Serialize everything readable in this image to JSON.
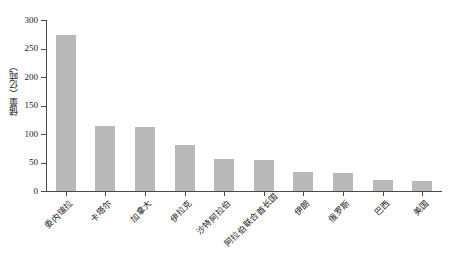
{
  "chart_data": {
    "type": "bar",
    "title": "",
    "xlabel": "",
    "ylabel": "储量（亿吨）",
    "ylim": [
      0,
      300
    ],
    "ytick_labels": [
      "0",
      "50",
      "100",
      "150",
      "200",
      "250",
      "300"
    ],
    "ytick_values": [
      0,
      50,
      100,
      150,
      200,
      250,
      300
    ],
    "grid": false,
    "legend": "none",
    "bar_color": "#b9b9b9",
    "axis_color": "#4a4a4a",
    "categories": [
      "委内瑞拉",
      "卡塔尔",
      "加拿大",
      "伊拉克",
      "沙特阿拉伯",
      "阿拉伯联合酋长国",
      "伊朗",
      "俄罗斯",
      "巴西",
      "美国"
    ],
    "values": [
      273,
      114,
      113,
      81,
      57,
      54,
      33,
      32,
      19,
      18
    ]
  }
}
